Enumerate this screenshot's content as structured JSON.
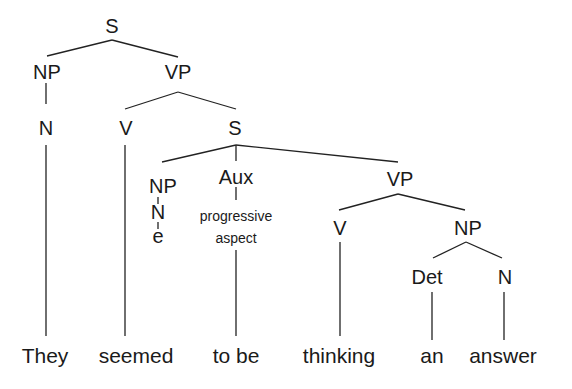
{
  "diagram": {
    "type": "syntax-tree",
    "nodes": {
      "root_s": "S",
      "subj_np": "NP",
      "subj_n": "N",
      "main_vp": "VP",
      "main_v": "V",
      "embedded_s": "S",
      "embedded_np": "NP",
      "embedded_n": "N",
      "empty": "e",
      "aux": "Aux",
      "aux_note_line1": "progressive",
      "aux_note_line2": "aspect",
      "embedded_vp": "VP",
      "embedded_v": "V",
      "obj_np": "NP",
      "det": "Det",
      "obj_n": "N"
    },
    "words": [
      "They",
      "seemed",
      "to be",
      "thinking",
      "an",
      "answer"
    ],
    "colors": {
      "text": "#1a1a1a",
      "lines": "#222222",
      "background": "#ffffff"
    }
  }
}
